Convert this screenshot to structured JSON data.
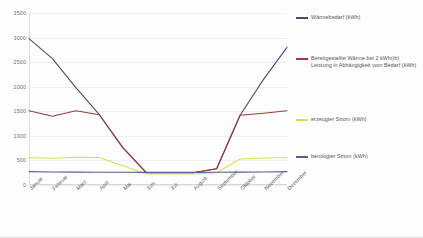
{
  "chart_data": {
    "type": "line",
    "title": "",
    "xlabel": "",
    "ylabel": "",
    "ylim": [
      0,
      3500
    ],
    "yticks": [
      0,
      500,
      1000,
      1500,
      2000,
      2500,
      3000,
      3500
    ],
    "grid": true,
    "legend_position": "right",
    "categories": [
      "Januar",
      "Februar",
      "März",
      "April",
      "Mai",
      "Juni",
      "Juli",
      "August",
      "September",
      "Oktober",
      "November",
      "Dezember"
    ],
    "series": [
      {
        "name": "Wärmebedarf (kWh)",
        "color": "#4a4a74",
        "values": [
          2980,
          2570,
          1980,
          1430,
          760,
          250,
          250,
          250,
          330,
          1420,
          2150,
          2800
        ]
      },
      {
        "name": "Bereitgestellte Wärme bei 2 kWh(th) Leistung in Abhängigkeit vom Bedarf (kWh)",
        "color": "#973c3c",
        "values": [
          1510,
          1400,
          1510,
          1430,
          760,
          250,
          250,
          250,
          330,
          1420,
          1460,
          1510
        ]
      },
      {
        "name": "erzeugter Strom (kWh)",
        "color": "#d4e05a",
        "values": [
          555,
          545,
          565,
          560,
          390,
          225,
          225,
          225,
          250,
          530,
          550,
          555
        ]
      },
      {
        "name": "benötigter Strom (kWh)",
        "color": "#555f91",
        "values": [
          272,
          266,
          262,
          260,
          258,
          256,
          256,
          256,
          258,
          262,
          266,
          272
        ]
      }
    ]
  }
}
